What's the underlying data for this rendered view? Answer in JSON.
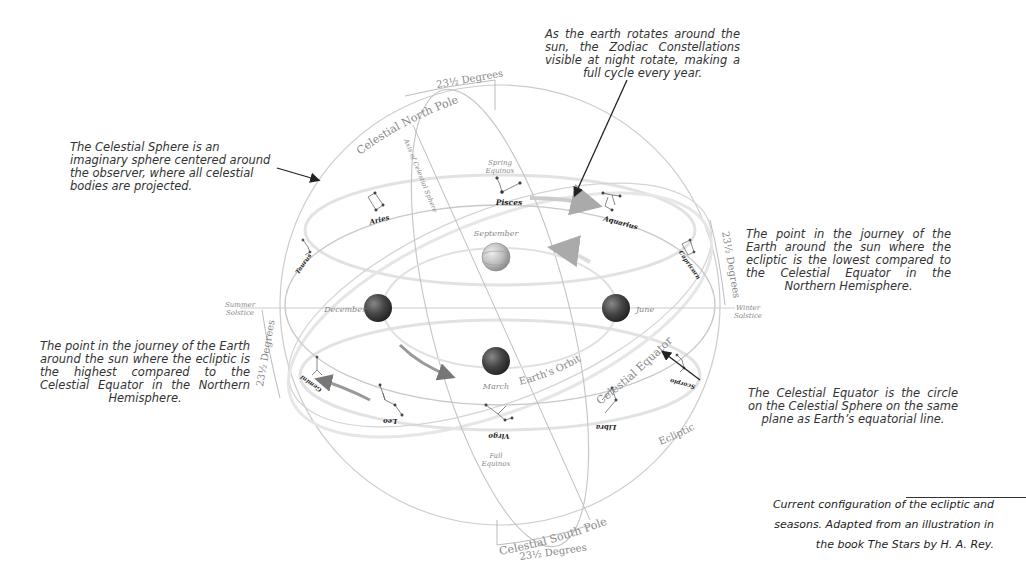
{
  "annotations": {
    "zodiac_rotation": "As the earth rotates around the sun, the Zodiac Constellations visible at night rotate, making a full cycle every year.",
    "celestial_sphere": "The Celestial Sphere is an imaginary sphere centered around the observer, where all celestial bodies are projected.",
    "winter_solstice_point": "The point in the journey of the Earth around the sun where the ecliptic is the lowest compared to the Celestial Equator in the Northern Hemisphere.",
    "summer_solstice_point": "The point in the journey of the Earth around the sun where the ecliptic is the highest compared to the Celestial Equator in the Northern Hemisphere.",
    "celestial_equator": "The Celestial Equator is the circle on the Celestial Sphere on the same plane as Earth’s equatorial line."
  },
  "caption": {
    "line1": "Current configuration of the ecliptic and",
    "line2": "seasons. Adapted from an illustration in",
    "line3": "the book The Stars by H. A. Rey."
  },
  "diagram": {
    "north_pole": "Celestial North Pole",
    "south_pole": "Celestial South Pole",
    "axis": "Axis of Celestial Sphere",
    "tilt_top": "23½ Degrees",
    "tilt_bottom": "23½ Degrees",
    "tilt_right": "23½ Degrees",
    "tilt_left": "23½ Degrees",
    "spring_equinox_1": "Spring",
    "spring_equinox_2": "Equinox",
    "fall_equinox_1": "Fall",
    "fall_equinox_2": "Equinox",
    "summer_solstice_1": "Summer",
    "summer_solstice_2": "Solstice",
    "winter_solstice_1": "Winter",
    "winter_solstice_2": "Solstice",
    "earth_orbit": "Earth's Orbit",
    "celestial_equator": "Celestial Equator",
    "ecliptic": "Ecliptic",
    "months": {
      "september": "September",
      "december": "December",
      "june": "June",
      "march": "March"
    },
    "constellations": {
      "pisces": "Pisces",
      "aquarius": "Aquarius",
      "aries": "Aries",
      "taurus": "Taurus",
      "capricorn": "Capricorn",
      "gemini": "Gemini",
      "leo": "Leo",
      "virgo": "Virgo",
      "libra": "Libra",
      "scorpio": "Scorpio"
    }
  }
}
